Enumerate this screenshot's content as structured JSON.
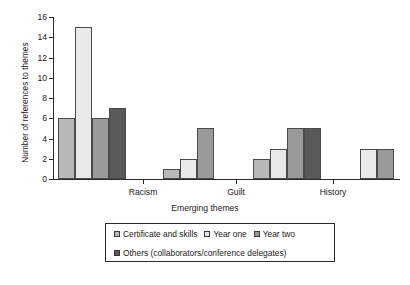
{
  "chart_data": {
    "type": "bar",
    "title": "",
    "subtitle": "",
    "xlabel": "Emerging themes",
    "ylabel": "Number of references to themes",
    "categories": [
      "Racism",
      "Guilt",
      "History",
      "Trust"
    ],
    "series": [
      {
        "name": "Certificate and skills",
        "color": "#b9b9b9",
        "values": [
          6,
          1,
          2,
          null
        ]
      },
      {
        "name": "Year one",
        "color": "#e9e9e9",
        "values": [
          15,
          2,
          3,
          3
        ]
      },
      {
        "name": "Year two",
        "color": "#9a9a9a",
        "values": [
          6,
          5,
          5,
          3
        ]
      },
      {
        "name": "Others (collaborators/conference delegates)",
        "color": "#595959",
        "values": [
          7,
          null,
          5,
          null
        ]
      }
    ],
    "ylim": [
      0,
      16
    ],
    "ytick_step": 2,
    "yticks": [
      "0",
      "2",
      "4",
      "6",
      "8",
      "10",
      "12",
      "14",
      "16"
    ],
    "grid": false,
    "legend_position": "bottom-center",
    "axis_color": "#2b2b2b",
    "bar_edge_color": "#4a4a4a"
  },
  "legend": {
    "row1": [
      {
        "label": "Certificate and skills",
        "color": "#b9b9b9"
      },
      {
        "label": "Year one",
        "color": "#e9e9e9"
      },
      {
        "label": "Year two",
        "color": "#9a9a9a"
      }
    ],
    "row2": [
      {
        "label": "Others (collaborators/conference delegates)",
        "color": "#595959"
      }
    ]
  }
}
